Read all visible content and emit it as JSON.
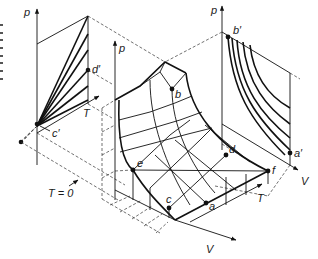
{
  "figure": {
    "colors": {
      "line": "#111111",
      "dashed": "#333333",
      "background": "#ffffff"
    }
  },
  "labels": {
    "left_p_axis": "p",
    "left_T_axis": "T",
    "center_p_axis": "p",
    "right_p_axis": "p",
    "right_V_axis": "V",
    "center_V_axis": "V",
    "center_T_axis": "T",
    "T_zero": "T = 0",
    "point_a": "a",
    "point_b": "b",
    "point_c": "c",
    "point_d": "d",
    "point_e": "e",
    "point_f": "f",
    "point_a_prime": "a′",
    "point_b_prime": "b′",
    "point_c_prime": "c′",
    "point_d_prime": "d′",
    "point_e_prime": "e′"
  }
}
